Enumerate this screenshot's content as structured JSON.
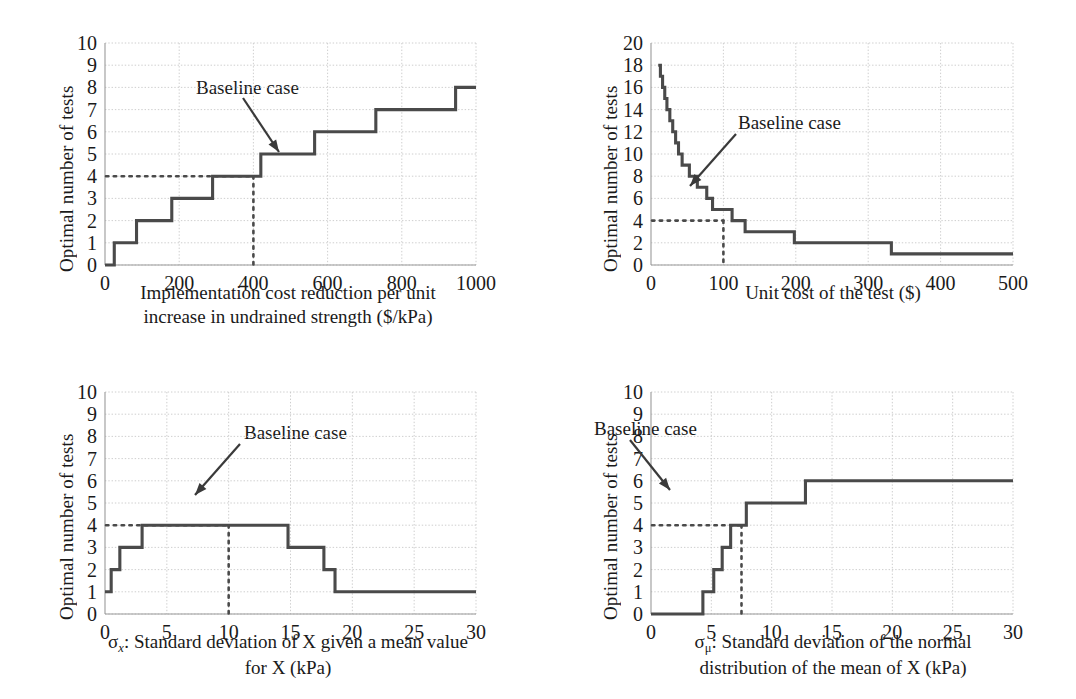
{
  "figure": {
    "type": "multi-panel-step-charts",
    "panels": 4,
    "annotation_label": "Baseline case",
    "line_color": "#4a4a4a",
    "grid_color": "#c8c8c8"
  },
  "chart_data": [
    {
      "type": "line",
      "id": "panel-a",
      "title": "",
      "xlabel_line1": "Implementation cost reduction per unit",
      "xlabel_line2": "increase in undrained strength ($/kPa)",
      "ylabel": "Optimal number of tests",
      "xlim": [
        0,
        1000
      ],
      "ylim": [
        0,
        10
      ],
      "xticks": [
        0,
        200,
        400,
        600,
        800,
        1000
      ],
      "yticks": [
        0,
        1,
        2,
        3,
        4,
        5,
        6,
        7,
        8,
        9,
        10
      ],
      "grid": true,
      "step_style": "post",
      "x": [
        0,
        25,
        85,
        180,
        290,
        420,
        565,
        730,
        945,
        1000
      ],
      "y": [
        0,
        1,
        2,
        3,
        4,
        5,
        6,
        7,
        8,
        8
      ],
      "baseline": {
        "x": 400,
        "y": 4,
        "label": "Baseline case"
      },
      "annotation_xy": [
        196,
        77
      ],
      "arrow_from": [
        243,
        98
      ],
      "arrow_to": [
        279,
        152
      ]
    },
    {
      "type": "line",
      "id": "panel-b",
      "title": "",
      "xlabel_line1": "Unit cost of the test ($)",
      "xlabel_line2": "",
      "ylabel": "Optimal number of tests",
      "xlim": [
        0,
        500
      ],
      "ylim": [
        0,
        20
      ],
      "xticks": [
        0,
        100,
        200,
        300,
        400,
        500
      ],
      "yticks": [
        0,
        2,
        4,
        6,
        8,
        10,
        12,
        14,
        16,
        18,
        20
      ],
      "grid": true,
      "step_style": "post",
      "x": [
        10,
        13,
        16,
        19,
        22,
        26,
        30,
        34,
        38,
        43,
        48,
        53,
        58,
        64,
        70,
        77,
        85,
        95,
        112,
        130,
        198,
        332,
        500
      ],
      "y": [
        18,
        17,
        16,
        15,
        14,
        13,
        12,
        11,
        10,
        9,
        9,
        8,
        8,
        7,
        7,
        6,
        5,
        5,
        4,
        3,
        2,
        1,
        1
      ],
      "baseline": {
        "x": 100,
        "y": 4,
        "label": "Baseline case"
      },
      "annotation_xy": [
        200,
        112
      ],
      "arrow_from": [
        198,
        134
      ],
      "arrow_to": [
        152,
        186
      ]
    },
    {
      "type": "line",
      "id": "panel-c",
      "title": "",
      "xlabel_line1": "σx: Standard deviation of X given a mean value",
      "xlabel_line2": "for X (kPa)",
      "ylabel": "Optimal number of tests",
      "xlim": [
        0,
        30
      ],
      "ylim": [
        0,
        10
      ],
      "xticks": [
        0,
        5,
        10,
        15,
        20,
        25,
        30
      ],
      "yticks": [
        0,
        1,
        2,
        3,
        4,
        5,
        6,
        7,
        8,
        9,
        10
      ],
      "grid": true,
      "step_style": "post",
      "x": [
        0,
        0.5,
        1.2,
        3.0,
        14.8,
        17.7,
        18.6,
        30
      ],
      "y": [
        1,
        2,
        3,
        4,
        3,
        2,
        1,
        1
      ],
      "baseline": {
        "x": 10,
        "y": 4,
        "label": "Baseline case"
      },
      "annotation_xy": [
        244,
        72
      ],
      "arrow_from": [
        240,
        94
      ],
      "arrow_to": [
        195,
        145
      ]
    },
    {
      "type": "line",
      "id": "panel-d",
      "title": "",
      "xlabel_line1": "σμ: Standard deviation of the normal",
      "xlabel_line2": "distribution of the mean of X (kPa)",
      "ylabel": "Optimal number of tests",
      "xlim": [
        0,
        30
      ],
      "ylim": [
        0,
        10
      ],
      "xticks": [
        0,
        5,
        10,
        15,
        20,
        25,
        30
      ],
      "yticks": [
        0,
        1,
        2,
        3,
        4,
        5,
        6,
        7,
        8,
        9,
        10
      ],
      "grid": true,
      "step_style": "post",
      "x": [
        0,
        4.3,
        5.2,
        5.9,
        6.6,
        7.9,
        12.8,
        30
      ],
      "y": [
        0,
        1,
        2,
        3,
        4,
        5,
        6,
        6
      ],
      "baseline": {
        "x": 7.5,
        "y": 4,
        "label": "Baseline case"
      },
      "annotation_xy": [
        56,
        68
      ],
      "arrow_from": [
        92,
        90
      ],
      "arrow_to": [
        132,
        140
      ]
    }
  ]
}
